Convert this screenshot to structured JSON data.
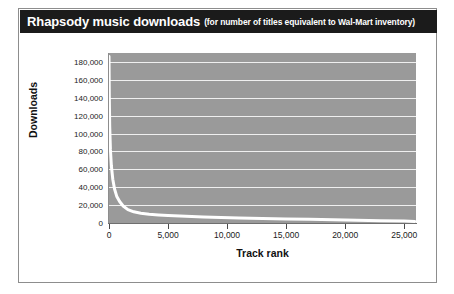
{
  "figure": {
    "title": "Rhapsody music downloads",
    "subtitle": "(for number of titles equivalent to Wal-Mart inventory)",
    "title_bar_color": "#1b1b1b",
    "title_text_color": "#ffffff",
    "border_color": "#8d8d8d",
    "background_color": "#ffffff"
  },
  "chart_data": {
    "type": "line",
    "title": "Rhapsody music downloads",
    "subtitle": "(for number of titles equivalent to Wal-Mart inventory)",
    "xlabel": "Track rank",
    "ylabel": "Downloads",
    "xlim": [
      0,
      26000
    ],
    "ylim": [
      0,
      190000
    ],
    "xticks": [
      0,
      5000,
      10000,
      15000,
      20000,
      25000
    ],
    "xtick_labels": [
      "0",
      "5,000",
      "10,000",
      "15,000",
      "20,000",
      "25,000"
    ],
    "yticks": [
      0,
      20000,
      40000,
      60000,
      80000,
      100000,
      120000,
      140000,
      160000,
      180000
    ],
    "ytick_labels": [
      "0",
      "20,000",
      "40,000",
      "60,000",
      "80,000",
      "100,000",
      "120,000",
      "140,000",
      "160,000",
      "180,000"
    ],
    "grid": "horizontal",
    "grid_color": "#efefef",
    "plot_background_color": "#9a9a9a",
    "line_color": "#ffffff",
    "line_width": 3,
    "legend": "none",
    "series": [
      {
        "name": "Rhapsody downloads by track rank",
        "x": [
          1,
          25,
          60,
          120,
          200,
          320,
          470,
          650,
          900,
          1200,
          1600,
          2100,
          2700,
          3400,
          4200,
          5000,
          6000,
          7000,
          8000,
          9500,
          11000,
          13000,
          15000,
          17000,
          19000,
          21000,
          23000,
          25000,
          25900
        ],
        "y": [
          186000,
          142000,
          108000,
          82000,
          64000,
          49000,
          38000,
          30000,
          24000,
          19000,
          15000,
          12500,
          11000,
          9800,
          9000,
          8400,
          7800,
          7200,
          6800,
          6200,
          5700,
          5100,
          4600,
          4100,
          3600,
          3100,
          2600,
          2100,
          1800
        ]
      }
    ]
  }
}
